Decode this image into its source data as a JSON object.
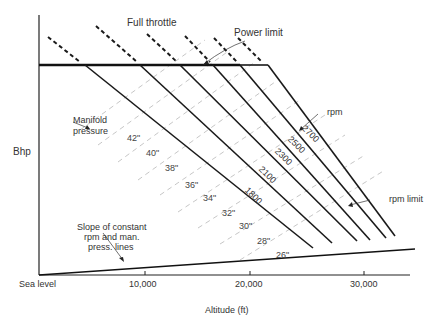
{
  "diagram": {
    "title": "",
    "y_axis_label": "Bhp",
    "x_axis_label": "Altitude (ft)",
    "x_ticks": [
      "Sea level",
      "10,000",
      "20,000",
      "30,000"
    ],
    "annotations": {
      "full_throttle": "Full throttle",
      "power_limit": "Power limit",
      "manifold_pressure_line1": "Manifold",
      "manifold_pressure_line2": "pressure",
      "rpm": "rpm",
      "rpm_limit": "rpm limit",
      "slope_line1": "Slope of constant",
      "slope_line2": "rpm and man.",
      "slope_line3": "press. lines"
    },
    "rpm_lines": [
      "1800",
      "2100",
      "2300",
      "2500",
      "2700"
    ],
    "manifold_pressures": [
      "42\"",
      "40\"",
      "38\"",
      "36\"",
      "34\"",
      "32\"",
      "30\"",
      "28\"",
      "26\""
    ],
    "colors": {
      "line": "#1a1a1a",
      "dashed_guide": "#b5b5b5",
      "text": "#333333"
    }
  }
}
